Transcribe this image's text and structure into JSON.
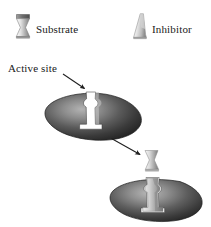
{
  "figure": {
    "background_color": "#ffffff"
  },
  "legend": {
    "items": [
      {
        "key": "substrate",
        "label": "Substrate",
        "icon": "hourglass-shape-icon",
        "shape": "hourglass",
        "fill_light": "#f2f2f2",
        "fill_dark": "#6b6b6b"
      },
      {
        "key": "inhibitor",
        "label": "Inhibitor",
        "icon": "wedge-shape-icon",
        "shape": "wedge",
        "fill_light": "#f7f7f7",
        "fill_dark": "#8a8a8a"
      }
    ]
  },
  "annotations": {
    "active_site": {
      "label": "Active site",
      "pointer": "arrow-down-right"
    }
  },
  "diagram": {
    "enzyme_top": {
      "name": "enzyme-empty-active-site",
      "shape": "ellipse",
      "cleft": "notched-active-site",
      "fill_dark": "#2e2e2e",
      "fill_highlight": "#9a9a9a"
    },
    "enzyme_bottom": {
      "name": "enzyme-substrate-bound",
      "shape": "ellipse",
      "cleft": "notched-active-site",
      "bound_molecule": "substrate",
      "fill_dark": "#2e2e2e",
      "fill_highlight": "#9a9a9a"
    },
    "process_arrow": {
      "name": "binding-arrow",
      "direction": "down-right"
    }
  }
}
